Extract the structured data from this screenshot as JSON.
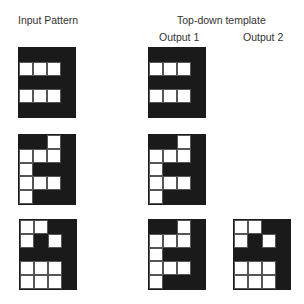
{
  "labels": {
    "input": "Input Pattern",
    "template": "Top-down template",
    "output1": "Output 1",
    "output2": "Output 2"
  },
  "colors": {
    "filled": "#1a1a1a",
    "empty": "#ffffff"
  },
  "grids": [
    {
      "id": "input-1",
      "x": 18,
      "y": 47,
      "cells": [
        "BBBB",
        "WWWB",
        "BBBB",
        "WWWB",
        "BBBB"
      ]
    },
    {
      "id": "input-2",
      "x": 18,
      "y": 134,
      "cells": [
        "BBWB",
        "WWWB",
        "WBBB",
        "WWWB",
        "WBBB"
      ]
    },
    {
      "id": "input-3",
      "x": 19,
      "y": 219,
      "cells": [
        "WWBB",
        "WBWB",
        "BBBB",
        "WWWB",
        "WWWB"
      ]
    },
    {
      "id": "output1-1",
      "x": 148,
      "y": 47,
      "cells": [
        "BBBB",
        "WWWB",
        "BBBB",
        "WWWB",
        "BBBB"
      ]
    },
    {
      "id": "output1-2",
      "x": 148,
      "y": 134,
      "cells": [
        "BBWB",
        "WWWB",
        "WBBB",
        "WWWB",
        "WBBB"
      ]
    },
    {
      "id": "output1-3",
      "x": 148,
      "y": 219,
      "cells": [
        "BBWB",
        "WWWB",
        "WBBB",
        "WWWB",
        "WBBB"
      ]
    },
    {
      "id": "output2-3",
      "x": 233,
      "y": 219,
      "cells": [
        "WWBB",
        "WBWB",
        "BBBB",
        "WWWB",
        "WWWB"
      ]
    }
  ]
}
